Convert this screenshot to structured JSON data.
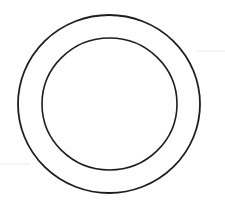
{
  "canvas": {
    "width": 225,
    "height": 207,
    "background": "#ffffff"
  },
  "figure": {
    "stroke_color": "#1e1e1e",
    "outer_circle": {
      "cx": 109,
      "cy": 104,
      "rx": 91,
      "ry": 89,
      "stroke_width": 1.8
    },
    "inner_circle": {
      "cx": 109.5,
      "cy": 104,
      "rx": 67.5,
      "ry": 66,
      "stroke_width": 1.6
    },
    "artifact_color": "#ececec",
    "artifact_line_right": {
      "x1": 196,
      "y1": 51,
      "x2": 225,
      "y2": 51,
      "stroke_width": 1
    },
    "artifact_line_left": {
      "x1": 0,
      "y1": 164,
      "x2": 30,
      "y2": 164,
      "stroke_width": 1
    }
  }
}
